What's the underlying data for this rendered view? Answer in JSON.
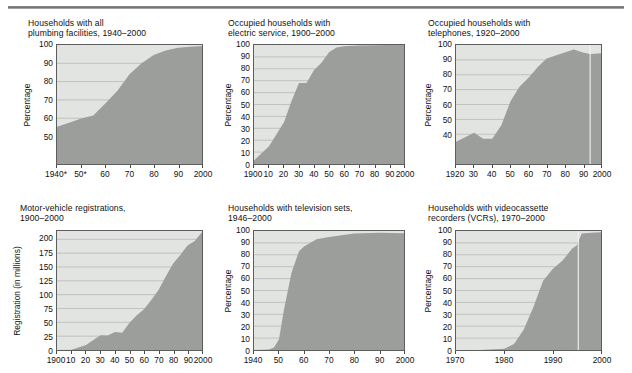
{
  "header": {
    "ghost_caption": "",
    "rule": "horizontal-rule"
  },
  "common": {
    "percentage_axis_label": "Percentage",
    "registration_axis_label": "Registration (in millions)"
  },
  "chart_data": [
    {
      "id": "plumbing",
      "type": "area",
      "title": "Households with all\nplumbing facilities, 1940–2000",
      "xlabel": "",
      "ylabel": "Percentage",
      "ylim": [
        35,
        100
      ],
      "yticks": [
        50,
        60,
        70,
        80,
        90,
        100
      ],
      "ytick_labels": [
        "50",
        "60",
        "70",
        "80",
        "90",
        "100"
      ],
      "xlim": [
        1940,
        2000
      ],
      "xticks": [
        1940,
        1950,
        1960,
        1970,
        1980,
        1990,
        2000
      ],
      "xtick_labels": [
        "1940*",
        "50*",
        "60",
        "70",
        "80",
        "90",
        "2000"
      ],
      "x": [
        1940,
        1945,
        1950,
        1955,
        1960,
        1965,
        1970,
        1975,
        1980,
        1985,
        1990,
        1995,
        2000
      ],
      "values": [
        55.4,
        57.5,
        59.8,
        61.5,
        68.0,
        75.0,
        84.0,
        90.0,
        94.5,
        97.0,
        98.5,
        99.1,
        99.4
      ]
    },
    {
      "id": "electric",
      "type": "area",
      "title": "Occupied households with\nelectric service, 1900–2000",
      "xlabel": "",
      "ylabel": "Percentage",
      "ylim": [
        0,
        100
      ],
      "yticks": [
        0,
        10,
        20,
        30,
        40,
        50,
        60,
        70,
        80,
        90,
        100
      ],
      "ytick_labels": [
        "0",
        "10",
        "20",
        "30",
        "40",
        "50",
        "60",
        "70",
        "80",
        "90",
        "100"
      ],
      "xlim": [
        1900,
        2000
      ],
      "xticks": [
        1900,
        1910,
        1920,
        1930,
        1940,
        1950,
        1960,
        1970,
        1980,
        1990,
        2000
      ],
      "xtick_labels": [
        "1900",
        "10",
        "20",
        "30",
        "40",
        "50",
        "60",
        "70",
        "80",
        "90",
        "2000"
      ],
      "x": [
        1900,
        1910,
        1920,
        1925,
        1930,
        1935,
        1940,
        1945,
        1950,
        1955,
        1960,
        1970,
        1980,
        1990,
        2000
      ],
      "values": [
        3,
        15,
        35,
        53,
        68,
        68,
        79,
        85,
        94,
        98,
        99,
        99.5,
        99.8,
        99.9,
        99.9
      ]
    },
    {
      "id": "telephones",
      "type": "area",
      "title": "Occupied households with\ntelephones, 1920–2000",
      "xlabel": "",
      "ylabel": "Percentage",
      "ylim": [
        20,
        100
      ],
      "yticks": [
        40,
        50,
        60,
        70,
        80,
        90,
        100
      ],
      "ytick_labels": [
        "40",
        "50",
        "60",
        "70",
        "80",
        "90",
        "100"
      ],
      "xlim": [
        1920,
        2000
      ],
      "xticks": [
        1920,
        1930,
        1940,
        1950,
        1960,
        1970,
        1980,
        1990,
        2000
      ],
      "xtick_labels": [
        "1920",
        "30",
        "40",
        "50",
        "60",
        "70",
        "80",
        "90",
        "2000"
      ],
      "x": [
        1920,
        1925,
        1930,
        1935,
        1940,
        1945,
        1950,
        1955,
        1960,
        1965,
        1970,
        1975,
        1980,
        1985,
        1990,
        1994,
        1995,
        2000
      ],
      "values": [
        35,
        38,
        41,
        37,
        37,
        46,
        62,
        72,
        78,
        85,
        91,
        93,
        95,
        97,
        95,
        94,
        93.9,
        94.5
      ],
      "annotations": [
        "white vertical break line near 1994"
      ]
    },
    {
      "id": "motor-vehicle",
      "type": "area",
      "title": "Motor-vehicle registrations,\n1900–2000",
      "xlabel": "",
      "ylabel": "Registration (in millions)",
      "ylim": [
        0,
        215
      ],
      "yticks": [
        0,
        25,
        50,
        75,
        100,
        125,
        150,
        175,
        200
      ],
      "ytick_labels": [
        "0",
        "25",
        "50",
        "75",
        "100",
        "125",
        "150",
        "175",
        "200"
      ],
      "xlim": [
        1900,
        2000
      ],
      "xticks": [
        1900,
        1910,
        1920,
        1930,
        1940,
        1950,
        1960,
        1970,
        1980,
        1990,
        2000
      ],
      "xtick_labels": [
        "1900",
        "10",
        "20",
        "30",
        "40",
        "50",
        "60",
        "70",
        "80",
        "90",
        "2000"
      ],
      "x": [
        1900,
        1910,
        1920,
        1930,
        1935,
        1940,
        1945,
        1950,
        1955,
        1960,
        1965,
        1970,
        1975,
        1980,
        1985,
        1990,
        1995,
        2000
      ],
      "values": [
        0.008,
        0.5,
        9.2,
        26.7,
        26.2,
        32.4,
        31.0,
        49.2,
        62.7,
        73.8,
        90.4,
        108.4,
        132.9,
        155.8,
        171.7,
        188.8,
        197.1,
        213.3
      ]
    },
    {
      "id": "television",
      "type": "area",
      "title": "Households with television sets,\n1946–2000",
      "xlabel": "",
      "ylabel": "Percentage",
      "ylim": [
        0,
        100
      ],
      "yticks": [
        0,
        10,
        20,
        30,
        40,
        50,
        60,
        70,
        80,
        90,
        100
      ],
      "ytick_labels": [
        "0",
        "10",
        "20",
        "30",
        "40",
        "50",
        "60",
        "70",
        "80",
        "90",
        "100"
      ],
      "xlim": [
        1940,
        2000
      ],
      "xticks": [
        1940,
        1950,
        1960,
        1970,
        1980,
        1990,
        2000
      ],
      "xtick_labels": [
        "1940",
        "50",
        "60",
        "70",
        "80",
        "90",
        "2000"
      ],
      "x": [
        1940,
        1946,
        1948,
        1950,
        1952,
        1955,
        1958,
        1960,
        1965,
        1970,
        1980,
        1990,
        2000
      ],
      "values": [
        0,
        0.5,
        2,
        9,
        34,
        65,
        83,
        87,
        93,
        95,
        98,
        98.5,
        98.2
      ]
    },
    {
      "id": "vcr",
      "type": "area",
      "title": "Households with videocassette\nrecorders (VCRs), 1970–2000",
      "xlabel": "",
      "ylabel": "Percentage",
      "ylim": [
        0,
        100
      ],
      "yticks": [
        0,
        10,
        20,
        30,
        40,
        50,
        60,
        70,
        80,
        90,
        100
      ],
      "ytick_labels": [
        "0",
        "10",
        "20",
        "30",
        "40",
        "50",
        "60",
        "70",
        "80",
        "90",
        "100"
      ],
      "xlim": [
        1970,
        2000
      ],
      "xticks": [
        1970,
        1980,
        1990,
        2000
      ],
      "xtick_labels": [
        "1970",
        "1980",
        "1990",
        "2000"
      ],
      "x": [
        1970,
        1975,
        1980,
        1982,
        1984,
        1986,
        1988,
        1990,
        1992,
        1994,
        1995,
        1996,
        1998,
        2000
      ],
      "values": [
        0,
        0,
        1.1,
        5,
        17,
        36,
        58,
        68,
        75,
        85,
        88,
        98,
        98.5,
        99
      ],
      "annotations": [
        "white vertical break line near 1995"
      ]
    }
  ],
  "style": {
    "plot_fill": "#9c9e9c",
    "plot_bg": "#e2e4e2",
    "frame": "#5d5d5d",
    "gridline": "#b0b2b0",
    "text": "#111111"
  }
}
